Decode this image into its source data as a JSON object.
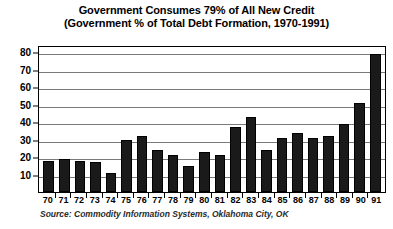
{
  "chart_data": {
    "type": "bar",
    "title": "Government Consumes 79% of All New Credit",
    "subtitle": "(Government % of Total Debt Formation, 1970-1991)",
    "title_lines": [
      "Government Consumes 79% of All New Credit",
      "(Government % of Total Debt Formation, 1970-1991)"
    ],
    "xlabel": "",
    "ylabel": "",
    "ylim": [
      0,
      84
    ],
    "y_ticks": [
      10,
      20,
      30,
      40,
      50,
      60,
      70,
      80
    ],
    "grid": true,
    "legend": "none",
    "bar_color": "#1a1a1a",
    "categories": [
      "70",
      "71",
      "72",
      "73",
      "74",
      "75",
      "76",
      "77",
      "78",
      "79",
      "80",
      "81",
      "82",
      "83",
      "84",
      "85",
      "86",
      "87",
      "88",
      "89",
      "90",
      "91"
    ],
    "values": [
      18,
      19,
      18,
      17,
      11,
      30,
      32,
      24,
      21,
      15,
      23,
      21,
      37,
      43,
      24,
      31,
      34,
      31,
      32,
      39,
      51,
      79
    ],
    "source": "Source: Commodity Information Systems, Oklahoma City, OK",
    "annotations": []
  }
}
